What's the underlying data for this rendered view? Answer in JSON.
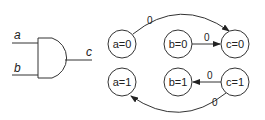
{
  "gate": {
    "type": "AND",
    "inputs": [
      "a",
      "b"
    ],
    "output": "c"
  },
  "graph": {
    "nodes": [
      {
        "id": "a0",
        "label": "a=0",
        "var": "a",
        "value": "0"
      },
      {
        "id": "b0",
        "label": "b=0",
        "var": "b",
        "value": "0"
      },
      {
        "id": "c0",
        "label": "c=0",
        "var": "c",
        "value": "0"
      },
      {
        "id": "a1",
        "label": "a=1",
        "var": "a",
        "value": "1"
      },
      {
        "id": "b1",
        "label": "b=1",
        "var": "b",
        "value": "1"
      },
      {
        "id": "c1",
        "label": "c=1",
        "var": "c",
        "value": "1"
      }
    ],
    "edges": [
      {
        "from": "a=0",
        "to": "c=0",
        "label": "0"
      },
      {
        "from": "b=0",
        "to": "c=0",
        "label": "0"
      },
      {
        "from": "c=1",
        "to": "b=1",
        "label": "0"
      },
      {
        "from": "c=1",
        "to": "a=1",
        "label": "0"
      }
    ]
  },
  "colors": {
    "stroke": "#333333",
    "background": "#ffffff"
  }
}
